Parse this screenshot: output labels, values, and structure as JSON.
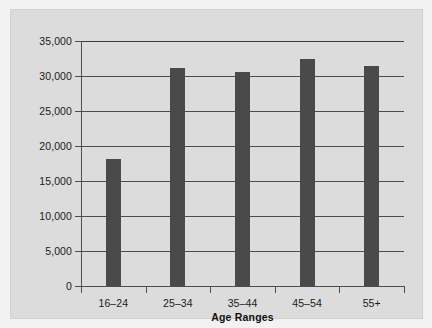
{
  "chart_data": {
    "type": "bar",
    "title": "",
    "subtitle": "",
    "xlabel": "Age Ranges",
    "ylabel": "",
    "categories": [
      "16–24",
      "25–34",
      "35–44",
      "45–54",
      "55+"
    ],
    "values": [
      18100,
      31200,
      30600,
      32500,
      31500
    ],
    "series": [
      {
        "name": "",
        "values": [
          18100,
          31200,
          30600,
          32500,
          31500
        ]
      }
    ],
    "ylim": [
      0,
      35000
    ],
    "yticks": [
      0,
      5000,
      10000,
      15000,
      20000,
      25000,
      30000,
      35000
    ],
    "ytick_labels": [
      "0",
      "5,000",
      "10,000",
      "15,000",
      "20,000",
      "25,000",
      "30,000",
      "35,000"
    ],
    "xtick_labels": [
      "16–24",
      "25–34",
      "35–44",
      "45–54",
      "55+"
    ],
    "grid": true,
    "grid_axis": "y",
    "legend": false,
    "legend_position": "none",
    "annotations": [],
    "colors": {
      "bar": "#4a4a4a",
      "panel_background": "#dcdcdc",
      "figure_background": "#f2f2f2",
      "axis": "#4d4d4d",
      "text": "#1b1b1b"
    }
  },
  "axis": {
    "x_title": "Age Ranges"
  }
}
